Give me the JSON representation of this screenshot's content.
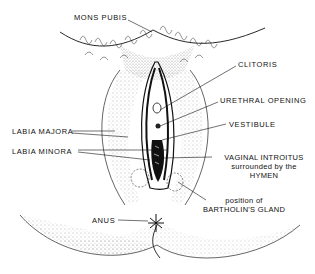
{
  "diagram": {
    "type": "anatomical illustration",
    "labels": {
      "mons_pubis": "MONS PUBIS",
      "clitoris": "CLITORIS",
      "urethral_opening": "URETHRAL OPENING",
      "vestibule": "VESTIBULE",
      "labia_majora": "LABIA MAJORA",
      "labia_minora": "LABIA MINORA",
      "vaginal_introitus_line1": "VAGINAL INTROITUS",
      "vaginal_introitus_line2": "surrounded by the",
      "vaginal_introitus_line3": "HYMEN",
      "bartholin_line1": "position of",
      "bartholin_line2": "BARTHOLIN'S GLAND",
      "anus": "ANUS"
    },
    "colors": {
      "ink": "#111111",
      "background": "#ffffff",
      "stipple": "#555555"
    }
  }
}
